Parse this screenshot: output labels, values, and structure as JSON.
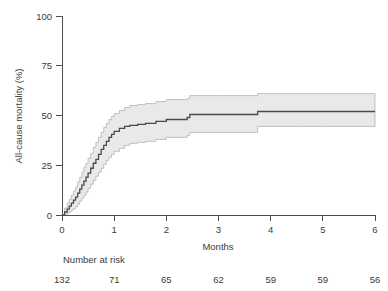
{
  "chart_data": {
    "type": "line",
    "title": "",
    "subtitle": "",
    "xlabel": "Months",
    "ylabel": "All-cause mortality (%)",
    "xlim": [
      0,
      6
    ],
    "ylim": [
      0,
      100
    ],
    "xticks": [
      0,
      1,
      2,
      3,
      4,
      5,
      6
    ],
    "xtick_labels": [
      "0",
      "1",
      "2",
      "3",
      "4",
      "5",
      "6"
    ],
    "yticks": [
      0,
      25,
      50,
      75,
      100
    ],
    "ytick_labels": [
      "0",
      "25",
      "50",
      "75",
      "100"
    ],
    "grid": false,
    "legend": false,
    "legend_position": "none",
    "annotations": [
      "Number at risk"
    ],
    "series": [
      {
        "name": "All-cause mortality (cumulative incidence)",
        "style": "step",
        "color": "#4a4a4a",
        "x": [
          0,
          0.05,
          0.1,
          0.14,
          0.18,
          0.22,
          0.26,
          0.3,
          0.34,
          0.38,
          0.42,
          0.46,
          0.5,
          0.55,
          0.6,
          0.65,
          0.7,
          0.75,
          0.8,
          0.85,
          0.9,
          0.95,
          1.0,
          1.1,
          1.2,
          1.3,
          1.45,
          1.6,
          1.8,
          2.0,
          2.4,
          2.45,
          3.0,
          3.7,
          3.75,
          4.5,
          5.0,
          6.0
        ],
        "y": [
          0,
          1.5,
          3.0,
          4.5,
          6.0,
          7.5,
          9.0,
          11.0,
          13.0,
          15.0,
          17.0,
          19.0,
          21.0,
          23.5,
          26.0,
          28.0,
          30.5,
          33.0,
          35.0,
          37.0,
          39.0,
          40.5,
          42.0,
          43.5,
          44.5,
          45.0,
          45.5,
          46.0,
          47.0,
          48.0,
          49.0,
          50.5,
          50.5,
          50.5,
          52.0,
          52.0,
          52.0,
          52.0
        ]
      },
      {
        "name": "Upper 95% CI",
        "style": "step",
        "color": "#b4b4b4",
        "x": [
          0,
          0.05,
          0.1,
          0.14,
          0.18,
          0.22,
          0.26,
          0.3,
          0.34,
          0.38,
          0.42,
          0.46,
          0.5,
          0.55,
          0.6,
          0.65,
          0.7,
          0.75,
          0.8,
          0.85,
          0.9,
          0.95,
          1.0,
          1.1,
          1.2,
          1.3,
          1.45,
          1.6,
          1.8,
          2.0,
          2.4,
          2.45,
          3.0,
          3.7,
          3.75,
          4.5,
          5.0,
          6.0
        ],
        "y": [
          0,
          3.5,
          6.0,
          8.0,
          10.0,
          12.0,
          14.0,
          16.5,
          19.0,
          21.5,
          24.0,
          26.0,
          28.5,
          31.0,
          34.0,
          36.5,
          39.0,
          41.5,
          44.0,
          46.0,
          48.0,
          49.5,
          51.0,
          52.5,
          54.0,
          55.0,
          55.5,
          56.0,
          57.0,
          58.0,
          58.5,
          60.0,
          60.0,
          60.0,
          61.0,
          61.0,
          61.0,
          61.0
        ]
      },
      {
        "name": "Lower 95% CI",
        "style": "step",
        "color": "#b4b4b4",
        "x": [
          0,
          0.05,
          0.1,
          0.14,
          0.18,
          0.22,
          0.26,
          0.3,
          0.34,
          0.38,
          0.42,
          0.46,
          0.5,
          0.55,
          0.6,
          0.65,
          0.7,
          0.75,
          0.8,
          0.85,
          0.9,
          0.95,
          1.0,
          1.1,
          1.2,
          1.3,
          1.45,
          1.6,
          1.8,
          2.0,
          2.4,
          2.45,
          3.0,
          3.7,
          3.75,
          4.5,
          5.0,
          6.0
        ],
        "y": [
          0,
          0.4,
          1.0,
          1.6,
          2.4,
          3.2,
          4.2,
          5.5,
          7.0,
          8.5,
          10.0,
          11.5,
          13.5,
          15.5,
          17.5,
          19.5,
          21.5,
          23.5,
          25.5,
          27.5,
          29.0,
          30.5,
          32.0,
          33.5,
          35.0,
          36.0,
          36.5,
          37.0,
          38.0,
          39.0,
          40.0,
          41.5,
          41.5,
          41.5,
          44.5,
          44.5,
          44.5,
          44.5
        ]
      }
    ],
    "risk_table": {
      "label": "Number at risk",
      "times": [
        0,
        1,
        2,
        3,
        4,
        5,
        6
      ],
      "counts": [
        "132",
        "71",
        "65",
        "62",
        "59",
        "59",
        "56"
      ]
    }
  }
}
